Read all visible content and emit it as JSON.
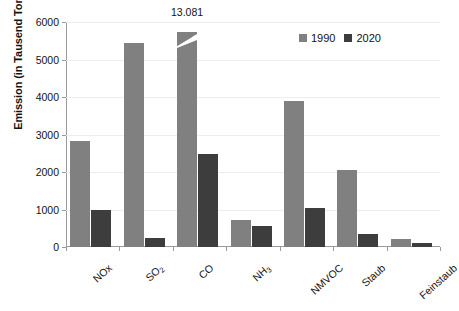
{
  "chart_data": {
    "type": "bar",
    "title": "",
    "subtitle": "",
    "xlabel": "",
    "ylabel": "Emission (in Tausend Tonnen)",
    "ylim": [
      0,
      6000
    ],
    "ytick_labels": [
      "0",
      "1000",
      "2000",
      "3000",
      "4000",
      "5000",
      "6000"
    ],
    "ytick_values": [
      0,
      1000,
      2000,
      3000,
      4000,
      5000,
      6000
    ],
    "grid": true,
    "grid_axis": "y",
    "legend_position": "top-right",
    "categories": [
      "NOx",
      "SO₂",
      "CO",
      "NH₃",
      "NMVOC",
      "Staub",
      "Feinstaub"
    ],
    "category_labels_html": [
      "NOx",
      "SO<sub>2</sub>",
      "CO",
      "NH<sub>3</sub>",
      "NMVOC",
      "Staub",
      "Feinstaub"
    ],
    "series": [
      {
        "name": "1990",
        "color": "#808080",
        "values": [
          2830,
          5450,
          13081,
          730,
          3900,
          2060,
          210
        ]
      },
      {
        "name": "2020",
        "color": "#3d3d3d",
        "values": [
          980,
          230,
          2470,
          550,
          1050,
          350,
          100
        ]
      }
    ],
    "annotations": [
      {
        "text": "13.081",
        "category": "CO",
        "series": "1990",
        "note": "value exceeds axis maximum; bar drawn truncated with break mark"
      }
    ],
    "truncated_bars": [
      {
        "category": "CO",
        "series": "1990",
        "drawn_to": 5600,
        "actual": 13081
      }
    ]
  },
  "legend": {
    "entries": [
      {
        "label": "1990",
        "color": "#808080"
      },
      {
        "label": "2020",
        "color": "#3d3d3d"
      }
    ]
  },
  "colors": {
    "series_1990": "#808080",
    "series_2020": "#3d3d3d",
    "axis": "#9a9a9a",
    "gridline": "#ededed",
    "text": "#131313",
    "background": "#ffffff"
  }
}
